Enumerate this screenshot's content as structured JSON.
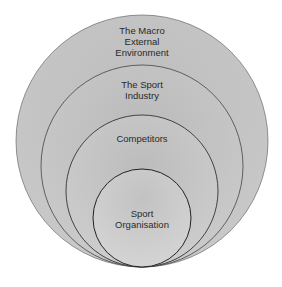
{
  "diagram": {
    "type": "nested-circles",
    "layers": [
      {
        "label": "The Macro External Environment",
        "lines": [
          "The Macro",
          "External",
          "Environment"
        ],
        "color": "#b9b9b9"
      },
      {
        "label": "The Sport Industry",
        "lines": [
          "The Sport",
          "Industry"
        ],
        "color": "#c0c0c0"
      },
      {
        "label": "Competitors",
        "lines": [
          "Competitors"
        ],
        "color": "#c6c6c6"
      },
      {
        "label": "Sport Organisation",
        "lines": [
          "Sport",
          "Organisation"
        ],
        "color": "#cdcdcd"
      }
    ]
  }
}
